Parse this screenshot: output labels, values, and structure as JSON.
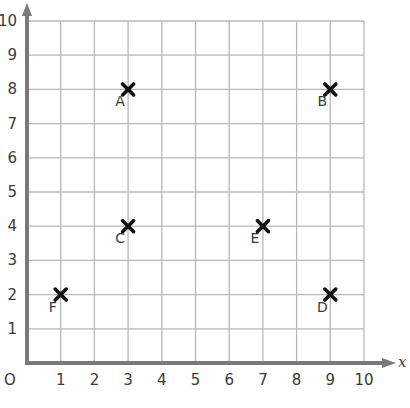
{
  "chart_data": {
    "type": "scatter",
    "title": "",
    "xlabel": "x",
    "ylabel": "",
    "origin_label": "O",
    "xlim": [
      0,
      10
    ],
    "ylim": [
      0,
      10
    ],
    "grid": true,
    "x_ticks": [
      "1",
      "2",
      "3",
      "4",
      "5",
      "6",
      "7",
      "8",
      "9",
      "10"
    ],
    "y_ticks": [
      "1",
      "2",
      "3",
      "4",
      "5",
      "6",
      "7",
      "8",
      "9",
      "10"
    ],
    "marker": "cross",
    "points": [
      {
        "label": "A",
        "x": 3,
        "y": 8
      },
      {
        "label": "B",
        "x": 9,
        "y": 8
      },
      {
        "label": "C",
        "x": 3,
        "y": 4
      },
      {
        "label": "D",
        "x": 9,
        "y": 2
      },
      {
        "label": "E",
        "x": 7,
        "y": 4
      },
      {
        "label": "F",
        "x": 1,
        "y": 2
      }
    ]
  },
  "colors": {
    "axis": "#7a7a7a",
    "grid": "#b8b8b8",
    "marker": "#111111",
    "text": "#3a3a3a"
  }
}
